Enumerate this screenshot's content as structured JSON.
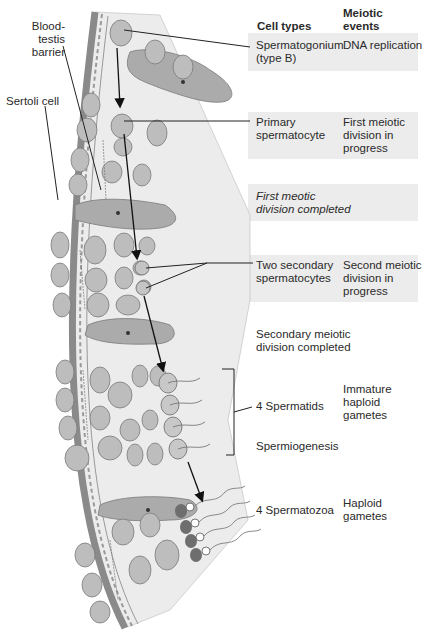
{
  "header": {
    "cell_types": "Cell types",
    "meiotic_events": "Meiotic\nevents"
  },
  "left_labels": {
    "blood_testis_barrier": "Blood-testis\nbarrier",
    "sertoli_cell": "Sertoli cell"
  },
  "rows": [
    {
      "cell_type": "Spermatogonium\n(type B)",
      "event": "DNA replication",
      "shaded": true
    },
    {
      "cell_type": "Primary\nspermatocyte",
      "event": "First meiotic\ndivision in\nprogress",
      "shaded": true
    },
    {
      "cell_type": "",
      "event": "First meotic\ndivision completed",
      "shaded": true,
      "italic": true
    },
    {
      "cell_type": "Two secondary\nspermatocytes",
      "event": "Second meiotic\ndivision in\nprogress",
      "shaded": true
    },
    {
      "cell_type": "",
      "event": "Secondary meiotic\ndivision completed",
      "shaded": false
    },
    {
      "cell_type": "4 Spermatids",
      "event": "Immature\nhaploid\ngametes",
      "shaded": false
    },
    {
      "cell_type": "",
      "event": "Spermiogenesis",
      "shaded": false
    },
    {
      "cell_type": "4 Spermatozoa",
      "event": "Haploid\ngametes",
      "shaded": false
    }
  ],
  "colors": {
    "band": "#ececec",
    "tissue_bg": "#e8e8e8",
    "cell_fill": "#b8b8b8",
    "sertoli_fill": "#a8a8a8",
    "outline": "#707070",
    "wall": "#8a8a8a",
    "arrow": "#111111"
  }
}
